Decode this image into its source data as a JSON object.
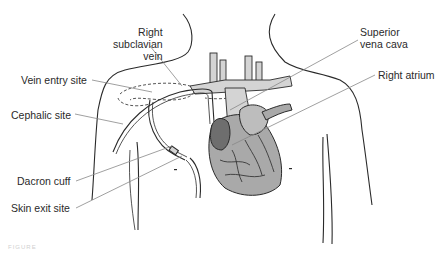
{
  "diagram": {
    "labels": {
      "right_subclavian_vein": [
        "Right",
        "subclavian",
        "vein"
      ],
      "vein_entry_site": "Vein entry site",
      "cephalic_site": "Cephalic site",
      "dacron_cuff": "Dacron cuff",
      "skin_exit_site": "Skin exit site",
      "superior_vena_cava": [
        "Superior",
        "vena cava"
      ],
      "right_atrium": "Right atrium"
    },
    "caption": "FIGURE",
    "colors": {
      "outline": "#2a2a2a",
      "vessel_fill": "#d4d4d4",
      "heart_fill": "#a9a9a9",
      "atrium_fill": "#6e6e6e",
      "leader_line": "#888888"
    }
  }
}
